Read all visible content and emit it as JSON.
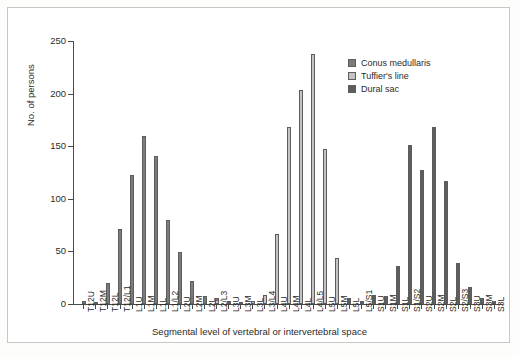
{
  "chart_data": {
    "type": "bar",
    "title": "",
    "xlabel": "Segmental level of vertebral or intervertebral space",
    "ylabel": "No. of persons",
    "ylim": [
      0,
      250
    ],
    "yticks": [
      0,
      50,
      100,
      150,
      200,
      250
    ],
    "grid": false,
    "legend_position": "top-right",
    "categories": [
      "T12U",
      "T12M",
      "T12L",
      "T12/L1",
      "L1U",
      "L1M",
      "L1L",
      "L1/L2",
      "L2U",
      "L2M",
      "L2L",
      "L2/L3",
      "L3U",
      "L3M",
      "L3L",
      "L3/L4",
      "L4U",
      "L4M",
      "L4L",
      "L4/L5",
      "L5U",
      "L5M",
      "L5L",
      "L5/S1",
      "S1U",
      "S1M",
      "S1L",
      "S1/S2",
      "S2U",
      "S2M",
      "S2L",
      "S2/S3",
      "S3U",
      "S3M",
      "S3L"
    ],
    "series": [
      {
        "name": "Conus medullaris",
        "color": "#7b7b7b",
        "values": [
          3,
          1,
          20,
          71,
          123,
          160,
          141,
          80,
          49,
          22,
          8,
          6,
          3,
          2,
          1,
          0,
          0,
          0,
          0,
          0,
          0,
          0,
          0,
          0,
          0,
          0,
          0,
          0,
          0,
          0,
          0,
          0,
          0,
          0,
          0
        ]
      },
      {
        "name": "Tuffier's line",
        "color": "#c4c4c4",
        "values": [
          0,
          0,
          0,
          0,
          0,
          0,
          0,
          0,
          0,
          0,
          0,
          4,
          2,
          1,
          3,
          9,
          67,
          168,
          203,
          238,
          147,
          44,
          6,
          3,
          0,
          0,
          0,
          0,
          0,
          0,
          0,
          0,
          0,
          0,
          0
        ]
      },
      {
        "name": "Dural sac",
        "color": "#5e5e5e",
        "values": [
          0,
          0,
          0,
          0,
          0,
          0,
          0,
          0,
          0,
          0,
          0,
          0,
          0,
          0,
          0,
          0,
          0,
          0,
          0,
          0,
          0,
          0,
          5,
          2,
          9,
          8,
          36,
          151,
          127,
          168,
          117,
          39,
          16,
          6,
          3
        ]
      }
    ]
  },
  "legend": {
    "items": [
      {
        "label": "Conus medullaris",
        "color": "#7b7b7b"
      },
      {
        "label": "Tuffier's line",
        "color": "#c4c4c4"
      },
      {
        "label": "Dural sac",
        "color": "#5e5e5e"
      }
    ]
  }
}
